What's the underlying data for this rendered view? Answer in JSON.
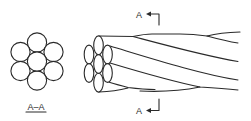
{
  "diagram": {
    "type": "wire-rope-section-view",
    "colors": {
      "line": "#2a2a2a",
      "background": "#ffffff"
    },
    "cross_section": {
      "label": "A–A",
      "wire_count": 7,
      "arrangement": "1 center + 6 around"
    },
    "side_view": {
      "end_face_wire_count": 7,
      "section_marker_top": {
        "letter": "A",
        "arrow": "left"
      },
      "section_marker_bottom": {
        "letter": "A",
        "arrow": "left"
      }
    }
  }
}
